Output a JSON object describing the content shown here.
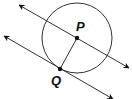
{
  "diagram": {
    "type": "geometry",
    "colors": {
      "stroke": "#333333",
      "point": "#111111",
      "background": "#ffffff"
    },
    "circle": {
      "center_label": "P",
      "cx": 77,
      "cy": 38,
      "r": 35
    },
    "points": [
      {
        "label": "P",
        "x": 77,
        "y": 38,
        "label_x": 76,
        "label_y": 31
      },
      {
        "label": "Q",
        "x": 60,
        "y": 69,
        "label_x": 51,
        "label_y": 85
      }
    ],
    "lines": [
      {
        "name": "line-through-P",
        "x1": 19,
        "y1": 5,
        "x2": 129,
        "y2": 68,
        "arrows": "both"
      },
      {
        "name": "tangent-line-at-Q",
        "x1": 4,
        "y1": 36,
        "x2": 113,
        "y2": 99,
        "arrows": "both"
      }
    ],
    "segments": [
      {
        "name": "radius-PQ",
        "from": "P",
        "to": "Q"
      }
    ]
  }
}
